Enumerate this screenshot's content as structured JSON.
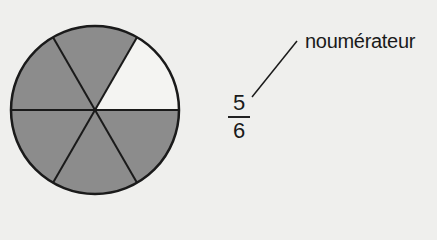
{
  "diagram": {
    "type": "fraction-pie",
    "total_parts": 6,
    "shaded_parts": 5,
    "unshaded_part_position": "upper-right",
    "colors": {
      "shaded": "#8c8c8c",
      "unshaded": "#f4f4f2",
      "outline": "#1a1a1a",
      "background": "#efefed"
    }
  },
  "fraction": {
    "numerator": "5",
    "denominator": "6"
  },
  "annotation": {
    "label": "noumérateur",
    "points_to": "numerator"
  }
}
